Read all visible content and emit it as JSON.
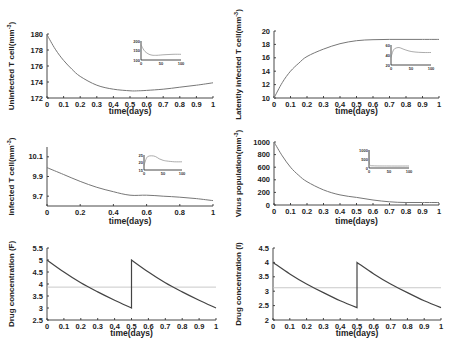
{
  "chart_data": [
    {
      "id": "uninfected",
      "type": "line",
      "xlabel": "time(days)",
      "ylabel": "Uninfected T cell(mm^-3)",
      "ylabel_text": "Uninfected T cell(mm",
      "ylabel_sup": "-3",
      "xlim": [
        0,
        1
      ],
      "ylim": [
        172,
        180
      ],
      "xticks": [
        "0",
        "0.1",
        "0.2",
        "0.3",
        "0.4",
        "0.5",
        "0.6",
        "0.7",
        "0.8",
        "0.9",
        "1"
      ],
      "yticks": [
        "172",
        "174",
        "176",
        "178",
        "180"
      ],
      "x": [
        0,
        0.05,
        0.1,
        0.15,
        0.2,
        0.3,
        0.4,
        0.5,
        0.55,
        0.6,
        0.7,
        0.8,
        0.9,
        1.0
      ],
      "values": [
        179.9,
        178.1,
        176.7,
        175.6,
        174.7,
        173.6,
        173.1,
        172.9,
        172.9,
        172.95,
        173.1,
        173.35,
        173.6,
        173.9
      ],
      "inset": {
        "xticks": [
          "0",
          "50",
          "100"
        ],
        "yticks": [
          "100",
          "150",
          "200"
        ],
        "ylim": [
          100,
          200
        ],
        "xlim": [
          0,
          100
        ],
        "x": [
          0,
          5,
          10,
          20,
          30,
          40,
          60,
          80,
          100
        ],
        "values": [
          180,
          160,
          145,
          130,
          125,
          125,
          128,
          130,
          130
        ]
      }
    },
    {
      "id": "latently-infected",
      "type": "line",
      "xlabel": "time(days)",
      "ylabel": "Latently infected T cell(mm^-3)",
      "ylabel_text": "Latently infected T cell(mm",
      "ylabel_sup": "-3",
      "xlim": [
        0,
        1
      ],
      "ylim": [
        10,
        20
      ],
      "xticks": [
        "0",
        "0.1",
        "0.2",
        "0.3",
        "0.4",
        "0.5",
        "0.6",
        "0.7",
        "0.8",
        "0.9",
        "1"
      ],
      "yticks": [
        "10",
        "12",
        "14",
        "16",
        "18",
        "20"
      ],
      "x": [
        0,
        0.05,
        0.1,
        0.15,
        0.2,
        0.3,
        0.4,
        0.5,
        0.6,
        0.7,
        0.8,
        0.9,
        1.0
      ],
      "values": [
        10,
        12.3,
        14.0,
        15.2,
        16.2,
        17.3,
        18.1,
        18.55,
        18.7,
        18.75,
        18.75,
        18.75,
        18.75
      ],
      "inset": {
        "xticks": [
          "0",
          "50",
          "100"
        ],
        "yticks": [
          "20",
          "40",
          "60"
        ],
        "ylim": [
          20,
          60
        ],
        "xlim": [
          0,
          100
        ],
        "x": [
          0,
          5,
          10,
          20,
          30,
          45,
          60,
          80,
          100
        ],
        "values": [
          35,
          48,
          53,
          55,
          52,
          48,
          46,
          45,
          45
        ]
      }
    },
    {
      "id": "infected",
      "type": "line",
      "xlabel": "time(days)",
      "ylabel": "Infected T cell(mm^-3)",
      "ylabel_text": "Infected T cell(mm",
      "ylabel_sup": "-3",
      "xlim": [
        0,
        1
      ],
      "ylim": [
        9.6,
        10.2
      ],
      "xticks": [
        "0",
        "0.2",
        "0.4",
        "0.6",
        "0.8",
        "1"
      ],
      "yticks": [
        "9.7",
        "9.9",
        "10.1"
      ],
      "x": [
        0,
        0.1,
        0.2,
        0.3,
        0.4,
        0.5,
        0.6,
        0.7,
        0.8,
        0.9,
        1.0
      ],
      "values": [
        9.99,
        9.92,
        9.85,
        9.79,
        9.745,
        9.71,
        9.71,
        9.7,
        9.69,
        9.675,
        9.655
      ],
      "inset": {
        "xticks": [
          "0",
          "50",
          "100"
        ],
        "yticks": [
          "15",
          "20",
          "25"
        ],
        "ylim": [
          15,
          25
        ],
        "xlim": [
          0,
          100
        ],
        "x": [
          0,
          5,
          10,
          20,
          30,
          40,
          50,
          60,
          80,
          100
        ],
        "values": [
          18,
          22,
          24,
          24.5,
          24,
          22.5,
          21.5,
          21,
          20.5,
          20.5
        ]
      }
    },
    {
      "id": "virus",
      "type": "line",
      "xlabel": "time(days)",
      "ylabel": "Virus population(mm^-3)",
      "ylabel_text": "Virus population(mm",
      "ylabel_sup": "-3",
      "xlim": [
        0,
        1
      ],
      "ylim": [
        0,
        1000
      ],
      "xticks": [
        "0",
        "0.1",
        "0.2",
        "0.3",
        "0.4",
        "0.5",
        "0.6",
        "0.7",
        "0.8",
        "0.9",
        "1"
      ],
      "yticks": [
        "0",
        "200",
        "400",
        "600",
        "800",
        "1000"
      ],
      "x": [
        0,
        0.05,
        0.1,
        0.15,
        0.2,
        0.3,
        0.4,
        0.5,
        0.6,
        0.7,
        0.8,
        0.9,
        1.0
      ],
      "values": [
        1000,
        780,
        600,
        470,
        370,
        240,
        160,
        120,
        80,
        50,
        40,
        40,
        40
      ],
      "inset": {
        "xticks": [
          "0",
          "50",
          "100"
        ],
        "yticks": [
          "0",
          "500",
          "1000"
        ],
        "ylim": [
          0,
          1000
        ],
        "xlim": [
          0,
          100
        ],
        "x": [
          0,
          1,
          3,
          10,
          50,
          100
        ],
        "values": [
          1000,
          300,
          150,
          120,
          110,
          110
        ]
      }
    },
    {
      "id": "drug-F",
      "type": "line",
      "xlabel": "time(days)",
      "ylabel": "Drug concentration (F)",
      "ylabel_text": "Drug concentration (F)",
      "xlim": [
        0,
        1
      ],
      "ylim": [
        2.5,
        5.5
      ],
      "xticks": [
        "0",
        "0.1",
        "0.2",
        "0.3",
        "0.4",
        "0.5",
        "0.6",
        "0.7",
        "0.8",
        "0.9",
        "1"
      ],
      "yticks": [
        "2.5",
        "3",
        "3.5",
        "4",
        "4.5",
        "5",
        "5.5"
      ],
      "x": [
        0,
        0.1,
        0.2,
        0.3,
        0.4,
        0.5,
        0.5,
        0.6,
        0.7,
        0.8,
        0.9,
        1.0
      ],
      "values": [
        5.0,
        4.5,
        4.05,
        3.67,
        3.32,
        3.0,
        5.0,
        4.5,
        4.05,
        3.67,
        3.32,
        3.0
      ],
      "threshold": 3.87
    },
    {
      "id": "drug-I",
      "type": "line",
      "xlabel": "time(days)",
      "ylabel": "Drug concentration (I)",
      "ylabel_text": "Drug concentration (I)",
      "xlim": [
        0,
        1
      ],
      "ylim": [
        2,
        4.5
      ],
      "xticks": [
        "0",
        "0.1",
        "0.2",
        "0.3",
        "0.4",
        "0.5",
        "0.6",
        "0.7",
        "0.8",
        "0.9",
        "1"
      ],
      "yticks": [
        "2",
        "2.5",
        "3",
        "3.5",
        "4",
        "4.5"
      ],
      "x": [
        0,
        0.1,
        0.2,
        0.3,
        0.4,
        0.5,
        0.5,
        0.6,
        0.7,
        0.8,
        0.9,
        1.0
      ],
      "values": [
        4.0,
        3.6,
        3.25,
        2.95,
        2.67,
        2.43,
        4.0,
        3.6,
        3.25,
        2.95,
        2.67,
        2.43
      ],
      "threshold": 3.12
    }
  ]
}
